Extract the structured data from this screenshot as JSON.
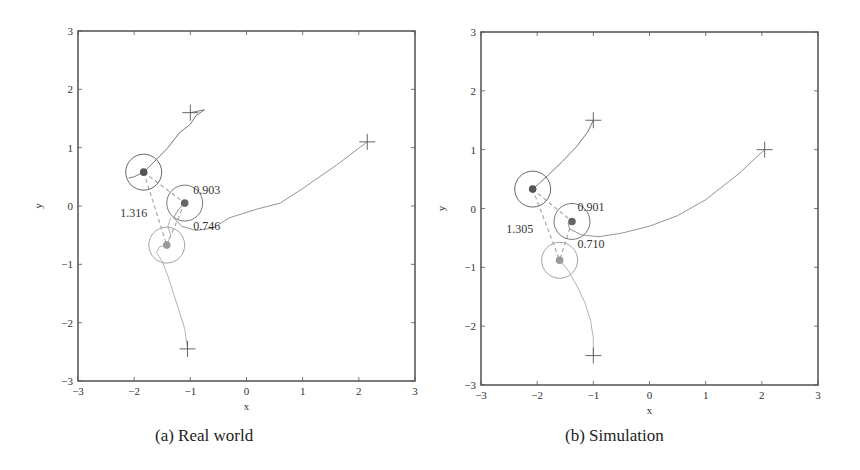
{
  "chart_data": [
    {
      "type": "line",
      "title": "",
      "caption": "(a) Real world",
      "xlabel": "x",
      "ylabel": "y",
      "xlim": [
        -3,
        3
      ],
      "ylim": [
        -3,
        3
      ],
      "xticks": [
        -3,
        -2,
        -1,
        0,
        1,
        2,
        3
      ],
      "yticks": [
        -3,
        -2,
        -1,
        0,
        1,
        2,
        3
      ],
      "grid": false,
      "start_markers": [
        {
          "x": -1.0,
          "y": 1.6
        },
        {
          "x": 2.15,
          "y": 1.1
        },
        {
          "x": -1.05,
          "y": -2.45
        }
      ],
      "agents": [
        {
          "x": -1.83,
          "y": 0.58,
          "radius": 0.32,
          "color": "#555555"
        },
        {
          "x": -1.1,
          "y": 0.05,
          "radius": 0.32,
          "color": "#666666"
        },
        {
          "x": -1.42,
          "y": -0.67,
          "radius": 0.32,
          "color": "#999999"
        }
      ],
      "series": [
        {
          "name": "trajectory-1",
          "color": "#666666",
          "points": [
            [
              -1.0,
              1.6
            ],
            [
              -0.75,
              1.65
            ],
            [
              -0.9,
              1.55
            ],
            [
              -1.0,
              1.4
            ],
            [
              -1.2,
              1.25
            ],
            [
              -1.4,
              1.0
            ],
            [
              -1.6,
              0.8
            ],
            [
              -1.83,
              0.58
            ],
            [
              -2.0,
              0.5
            ],
            [
              -2.1,
              0.48
            ]
          ]
        },
        {
          "name": "trajectory-2",
          "color": "#888888",
          "points": [
            [
              2.15,
              1.1
            ],
            [
              1.6,
              0.7
            ],
            [
              1.0,
              0.3
            ],
            [
              0.6,
              0.05
            ],
            [
              0.2,
              -0.05
            ],
            [
              -0.3,
              -0.2
            ],
            [
              -0.6,
              -0.38
            ],
            [
              -0.9,
              -0.42
            ],
            [
              -1.15,
              -0.35
            ],
            [
              -1.3,
              -0.2
            ],
            [
              -1.2,
              -0.05
            ],
            [
              -1.1,
              0.05
            ]
          ]
        },
        {
          "name": "trajectory-3",
          "color": "#aaaaaa",
          "points": [
            [
              -1.05,
              -2.45
            ],
            [
              -1.1,
              -2.1
            ],
            [
              -1.2,
              -1.8
            ],
            [
              -1.3,
              -1.5
            ],
            [
              -1.4,
              -1.2
            ],
            [
              -1.5,
              -0.95
            ],
            [
              -1.6,
              -0.8
            ],
            [
              -1.55,
              -0.7
            ],
            [
              -1.42,
              -0.67
            ],
            [
              -1.35,
              -0.5
            ],
            [
              -1.4,
              -0.35
            ],
            [
              -1.35,
              -0.2
            ]
          ]
        }
      ],
      "distances": [
        {
          "label": "0.903",
          "between": [
            0,
            1
          ],
          "x": -0.95,
          "y": 0.28
        },
        {
          "label": "1.316",
          "between": [
            0,
            2
          ],
          "x": -2.25,
          "y": -0.12
        },
        {
          "label": "0.746",
          "between": [
            1,
            2
          ],
          "x": -0.95,
          "y": -0.35
        }
      ]
    },
    {
      "type": "line",
      "title": "",
      "caption": "(b) Simulation",
      "xlabel": "x",
      "ylabel": "y",
      "xlim": [
        -3,
        3
      ],
      "ylim": [
        -3,
        3
      ],
      "xticks": [
        -3,
        -2,
        -1,
        0,
        1,
        2,
        3
      ],
      "yticks": [
        -3,
        -2,
        -1,
        0,
        1,
        2,
        3
      ],
      "grid": false,
      "start_markers": [
        {
          "x": -1.0,
          "y": 1.5
        },
        {
          "x": 2.05,
          "y": 1.0
        },
        {
          "x": -1.0,
          "y": -2.5
        }
      ],
      "agents": [
        {
          "x": -2.08,
          "y": 0.33,
          "radius": 0.32,
          "color": "#555555"
        },
        {
          "x": -1.38,
          "y": -0.22,
          "radius": 0.32,
          "color": "#666666"
        },
        {
          "x": -1.6,
          "y": -0.88,
          "radius": 0.32,
          "color": "#999999"
        }
      ],
      "series": [
        {
          "name": "trajectory-1",
          "color": "#666666",
          "points": [
            [
              -1.0,
              1.5
            ],
            [
              -1.1,
              1.3
            ],
            [
              -1.3,
              1.05
            ],
            [
              -1.55,
              0.8
            ],
            [
              -1.8,
              0.57
            ],
            [
              -2.08,
              0.33
            ]
          ]
        },
        {
          "name": "trajectory-2",
          "color": "#888888",
          "points": [
            [
              2.05,
              1.0
            ],
            [
              1.6,
              0.6
            ],
            [
              1.0,
              0.15
            ],
            [
              0.5,
              -0.12
            ],
            [
              0.0,
              -0.3
            ],
            [
              -0.5,
              -0.42
            ],
            [
              -0.9,
              -0.48
            ],
            [
              -1.2,
              -0.45
            ],
            [
              -1.42,
              -0.35
            ],
            [
              -1.45,
              -0.25
            ],
            [
              -1.38,
              -0.22
            ]
          ]
        },
        {
          "name": "trajectory-3",
          "color": "#aaaaaa",
          "points": [
            [
              -1.0,
              -2.5
            ],
            [
              -1.0,
              -2.2
            ],
            [
              -1.05,
              -1.9
            ],
            [
              -1.15,
              -1.6
            ],
            [
              -1.3,
              -1.3
            ],
            [
              -1.45,
              -1.05
            ],
            [
              -1.6,
              -0.88
            ]
          ]
        }
      ],
      "distances": [
        {
          "label": "0.901",
          "between": [
            0,
            1
          ],
          "x": -1.28,
          "y": 0.02
        },
        {
          "label": "1.305",
          "between": [
            0,
            2
          ],
          "x": -2.55,
          "y": -0.35
        },
        {
          "label": "0.710",
          "between": [
            1,
            2
          ],
          "x": -1.28,
          "y": -0.6
        }
      ]
    }
  ],
  "captions": {
    "a": "(a) Real world",
    "b": "(b) Simulation"
  }
}
